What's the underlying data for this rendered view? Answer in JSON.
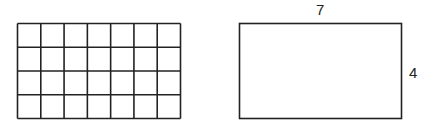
{
  "grid": {
    "columns": 7,
    "rows": 4,
    "x": 17.5,
    "y": 23.5,
    "width": 163,
    "height": 95,
    "stroke": "#222222"
  },
  "rectangle": {
    "x": 239.5,
    "y": 23.5,
    "width": 162,
    "height": 95,
    "stroke": "#222222",
    "top_label": "7",
    "side_label": "4"
  }
}
